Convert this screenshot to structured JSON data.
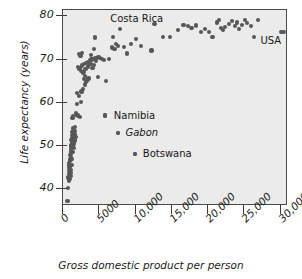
{
  "chart_data": {
    "type": "scatter",
    "title": "",
    "xlabel": "Gross domestic product per person",
    "ylabel": "Life expectancy (years)",
    "xlim": [
      0,
      31000
    ],
    "ylim": [
      36,
      81.5
    ],
    "xticks": [
      0,
      5000,
      10000,
      15000,
      20000,
      25000,
      30000
    ],
    "xtick_labels": [
      "0",
      "5000",
      "10,000",
      "15,000",
      "20,000",
      "25,000",
      "30,000"
    ],
    "yticks": [
      40,
      50,
      60,
      70,
      80
    ],
    "ytick_labels": [
      "40",
      "50",
      "60",
      "70",
      "80"
    ],
    "grid": false,
    "legend": "none",
    "marker_color": "#555759",
    "plot_background": "#ebebeb",
    "frame_color": "#4a4a4a",
    "annotations": [
      {
        "text": "Costa Rica",
        "x": 6500,
        "y": 79.4,
        "has_dot": false,
        "style": "upright"
      },
      {
        "text": "USA",
        "x": 27200,
        "y": 74.2,
        "has_dot": false,
        "style": "upright"
      },
      {
        "text": "Namibia",
        "x": 7000,
        "y": 57.0,
        "has_dot": true,
        "dot_x": 5800,
        "dot_y": 57.0,
        "style": "upright"
      },
      {
        "text": "Gabon",
        "x": 8600,
        "y": 53.0,
        "has_dot": true,
        "dot_x": 7600,
        "dot_y": 53.0,
        "style": "italic"
      },
      {
        "text": "Botswana",
        "x": 11000,
        "y": 48.1,
        "has_dot": true,
        "dot_x": 9900,
        "dot_y": 48.1,
        "style": "upright"
      }
    ],
    "points": [
      [
        620,
        37.1
      ],
      [
        700,
        40.1
      ],
      [
        760,
        42.6
      ],
      [
        820,
        43.4
      ],
      [
        780,
        44.2
      ],
      [
        860,
        44.8
      ],
      [
        900,
        45.4
      ],
      [
        840,
        46.0
      ],
      [
        920,
        46.5
      ],
      [
        980,
        45.0
      ],
      [
        1040,
        46.8
      ],
      [
        1080,
        47.3
      ],
      [
        1000,
        47.8
      ],
      [
        1120,
        48.2
      ],
      [
        1060,
        48.8
      ],
      [
        1140,
        49.3
      ],
      [
        1180,
        49.8
      ],
      [
        1090,
        50.2
      ],
      [
        1220,
        50.6
      ],
      [
        1260,
        51.0
      ],
      [
        1160,
        51.4
      ],
      [
        1300,
        51.8
      ],
      [
        1340,
        52.1
      ],
      [
        1240,
        52.4
      ],
      [
        1380,
        52.0
      ],
      [
        1420,
        51.5
      ],
      [
        1480,
        52.3
      ],
      [
        1530,
        52.8
      ],
      [
        1320,
        53.1
      ],
      [
        1580,
        51.9
      ],
      [
        1620,
        52.6
      ],
      [
        1700,
        51.2
      ],
      [
        1760,
        52.0
      ],
      [
        1420,
        54.0
      ],
      [
        1100,
        43.0
      ],
      [
        1040,
        43.6
      ],
      [
        960,
        42.2
      ],
      [
        880,
        41.9
      ],
      [
        1150,
        44.4
      ],
      [
        1210,
        45.6
      ],
      [
        1270,
        47.0
      ],
      [
        1330,
        48.5
      ],
      [
        1390,
        50.0
      ],
      [
        1450,
        50.8
      ],
      [
        1510,
        49.4
      ],
      [
        1560,
        50.4
      ],
      [
        1610,
        53.4
      ],
      [
        1680,
        54.4
      ],
      [
        1300,
        56.4
      ],
      [
        1360,
        56.9
      ],
      [
        1860,
        57.2
      ],
      [
        1820,
        57.6
      ],
      [
        2100,
        57.0
      ],
      [
        2380,
        56.6
      ],
      [
        1950,
        59.6
      ],
      [
        2450,
        60.2
      ],
      [
        2240,
        61.5
      ],
      [
        1900,
        62.3
      ],
      [
        2560,
        62.6
      ],
      [
        2700,
        63.1
      ],
      [
        2980,
        64.2
      ],
      [
        3160,
        64.8
      ],
      [
        2850,
        65.4
      ],
      [
        3340,
        65.1
      ],
      [
        3520,
        65.6
      ],
      [
        3060,
        66.2
      ],
      [
        2760,
        66.8
      ],
      [
        2520,
        67.4
      ],
      [
        2280,
        67.9
      ],
      [
        2050,
        68.3
      ],
      [
        2600,
        68.6
      ],
      [
        2900,
        68.9
      ],
      [
        3220,
        69.2
      ],
      [
        3460,
        69.5
      ],
      [
        3700,
        69.8
      ],
      [
        3920,
        70.0
      ],
      [
        4180,
        70.2
      ],
      [
        4420,
        70.3
      ],
      [
        4640,
        70.4
      ],
      [
        4880,
        70.5
      ],
      [
        5120,
        70.4
      ],
      [
        5380,
        70.2
      ],
      [
        5640,
        69.9
      ],
      [
        3780,
        69.0
      ],
      [
        3420,
        68.4
      ],
      [
        3100,
        67.8
      ],
      [
        2820,
        67.2
      ],
      [
        4060,
        68.0
      ],
      [
        4320,
        68.8
      ],
      [
        4560,
        69.6
      ],
      [
        2400,
        70.8
      ],
      [
        2180,
        71.2
      ],
      [
        2620,
        71.6
      ],
      [
        4240,
        72.4
      ],
      [
        3880,
        71.0
      ],
      [
        4780,
        66.0
      ],
      [
        5980,
        65.0
      ],
      [
        6300,
        70.1
      ],
      [
        6720,
        72.8
      ],
      [
        7100,
        72.4
      ],
      [
        7350,
        73.6
      ],
      [
        7600,
        73.2
      ],
      [
        7800,
        77.1
      ],
      [
        6900,
        75.2
      ],
      [
        4400,
        75.1
      ],
      [
        8400,
        73.0
      ],
      [
        8800,
        71.4
      ],
      [
        9400,
        73.6
      ],
      [
        10100,
        74.8
      ],
      [
        10700,
        73.2
      ],
      [
        12200,
        72.1
      ],
      [
        12600,
        78.2
      ],
      [
        13800,
        75.2
      ],
      [
        14700,
        75.3
      ],
      [
        15800,
        76.8
      ],
      [
        16600,
        78.1
      ],
      [
        17200,
        77.8
      ],
      [
        17700,
        77.4
      ],
      [
        18300,
        77.9
      ],
      [
        19000,
        76.4
      ],
      [
        19600,
        77.1
      ],
      [
        20100,
        76.3
      ],
      [
        20600,
        75.3
      ],
      [
        21200,
        78.6
      ],
      [
        21500,
        79.1
      ],
      [
        21800,
        77.3
      ],
      [
        22000,
        76.9
      ],
      [
        22300,
        77.6
      ],
      [
        22900,
        78.3
      ],
      [
        23300,
        79.0
      ],
      [
        23700,
        77.7
      ],
      [
        24000,
        78.6
      ],
      [
        24300,
        77.1
      ],
      [
        24700,
        78.0
      ],
      [
        25100,
        79.2
      ],
      [
        25400,
        78.4
      ],
      [
        25900,
        77.8
      ],
      [
        26300,
        75.2
      ],
      [
        26900,
        79.1
      ],
      [
        30100,
        76.3
      ],
      [
        30500,
        76.4
      ],
      [
        5800,
        57.0
      ],
      [
        7600,
        53.0
      ],
      [
        9900,
        48.1
      ]
    ]
  }
}
